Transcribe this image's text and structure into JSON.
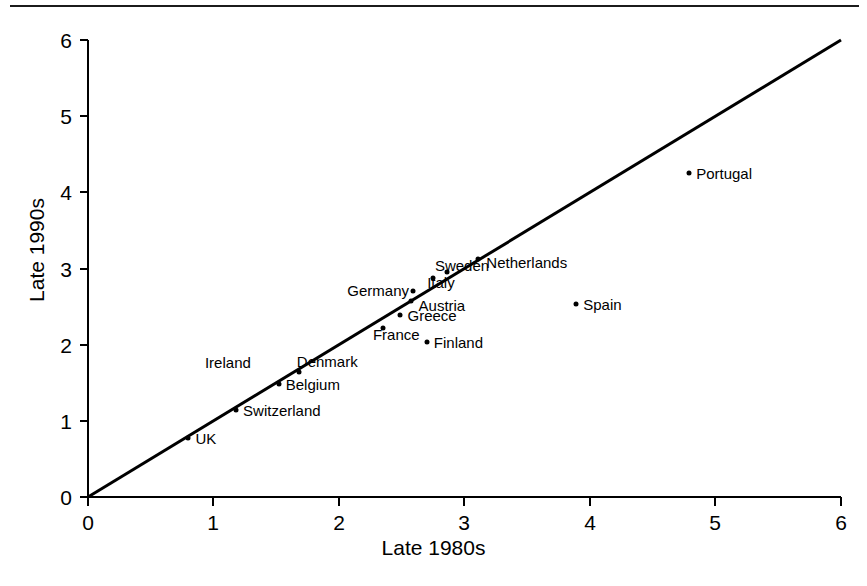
{
  "chart_data": {
    "type": "scatter",
    "title": "",
    "xlabel": "Late 1980s",
    "ylabel": "Late 1990s",
    "xlim": [
      0,
      6
    ],
    "ylim": [
      0,
      6
    ],
    "xticks": [
      "0",
      "1",
      "2",
      "3",
      "4",
      "5",
      "6"
    ],
    "yticks": [
      "0",
      "1",
      "2",
      "3",
      "4",
      "5",
      "6"
    ],
    "grid": false,
    "legend": "none",
    "reference_line": {
      "name": "45-degree-line",
      "from": [
        0,
        0
      ],
      "to": [
        6,
        6
      ],
      "color": "#000000"
    },
    "points": [
      {
        "label": "UK",
        "x": 0.8,
        "y": 0.77,
        "label_side": "right"
      },
      {
        "label": "Switzerland",
        "x": 1.18,
        "y": 1.14,
        "label_side": "right"
      },
      {
        "label": "Belgium",
        "x": 1.52,
        "y": 1.49,
        "label_side": "right"
      },
      {
        "label": "Denmark",
        "x": 1.68,
        "y": 1.64,
        "label_side": "right"
      },
      {
        "label": "Ireland",
        "x": 1.68,
        "y": 1.64,
        "label_side": "far-left"
      },
      {
        "label": "France",
        "x": 2.35,
        "y": 2.22,
        "label_side": "right"
      },
      {
        "label": "Greece",
        "x": 2.49,
        "y": 2.39,
        "label_side": "right"
      },
      {
        "label": "Austria",
        "x": 2.57,
        "y": 2.57,
        "label_side": "right"
      },
      {
        "label": "Germany",
        "x": 2.59,
        "y": 2.71,
        "label_side": "left"
      },
      {
        "label": "Finland",
        "x": 2.7,
        "y": 2.03,
        "label_side": "right"
      },
      {
        "label": "Italy",
        "x": 2.75,
        "y": 2.88,
        "label_side": "right"
      },
      {
        "label": "Sweden",
        "x": 2.86,
        "y": 2.96,
        "label_side": "right"
      },
      {
        "label": "Netherlands",
        "x": 3.11,
        "y": 3.12,
        "label_side": "right"
      },
      {
        "label": "Spain",
        "x": 3.89,
        "y": 2.54,
        "label_side": "right"
      },
      {
        "label": "Portugal",
        "x": 4.79,
        "y": 4.26,
        "label_side": "right"
      }
    ]
  },
  "axes": {
    "x_title": "Late 1980s",
    "y_title": "Late 1990s"
  }
}
